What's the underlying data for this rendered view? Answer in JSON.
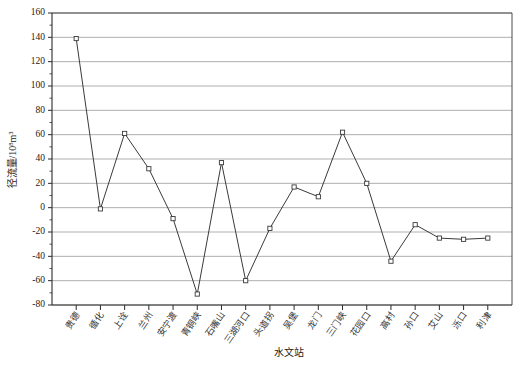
{
  "chart_data": {
    "type": "line",
    "title": "",
    "xlabel": "水文站",
    "ylabel": "径流量/10⁸m³",
    "ylabel_base": "径流量/10",
    "ylabel_exp": "8",
    "ylabel_unit": "m³",
    "ylim": [
      -80,
      160
    ],
    "ytick_step": 20,
    "yticks": [
      160,
      140,
      120,
      100,
      80,
      60,
      40,
      20,
      0,
      -20,
      -40,
      -60,
      -80
    ],
    "ytick_labels": [
      "160",
      "140",
      "120",
      "100",
      "80",
      "60",
      "40",
      "20",
      "0",
      "-20",
      "-40",
      "-60",
      "-80"
    ],
    "grid": true,
    "grid_orientation": "horizontal",
    "legend": "none",
    "marker": "open-square",
    "line_color": "#3a3a3a",
    "marker_fill": "#ffffff",
    "grid_color": "#8c8c8c",
    "categories": [
      "贵德",
      "循化",
      "上诠",
      "兰州",
      "安宁渡",
      "青铜峡",
      "石嘴山",
      "三湖河口",
      "头道拐",
      "吴堡",
      "龙门",
      "三门峡",
      "花园口",
      "高村",
      "孙口",
      "艾山",
      "泺口",
      "利津"
    ],
    "points": [
      {
        "station": "贵德",
        "value": 139
      },
      {
        "station": "循化",
        "value": -1
      },
      {
        "station": "上诠",
        "value": 61
      },
      {
        "station": "兰州",
        "value": 32
      },
      {
        "station": "安宁渡",
        "value": -9
      },
      {
        "station": "青铜峡",
        "value": -71
      },
      {
        "station": "石嘴山",
        "value": 37
      },
      {
        "station": "三湖河口",
        "value": -60
      },
      {
        "station": "头道拐",
        "value": -17
      },
      {
        "station": "吴堡",
        "value": 17
      },
      {
        "station": "龙门",
        "value": 9
      },
      {
        "station": "三门峡",
        "value": 62
      },
      {
        "station": "花园口",
        "value": 20
      },
      {
        "station": "高村",
        "value": -44
      },
      {
        "station": "孙口",
        "value": -14
      },
      {
        "station": "艾山",
        "value": -25
      },
      {
        "station": "泺口",
        "value": -26
      },
      {
        "station": "利津",
        "value": -25
      }
    ],
    "values": [
      139,
      -1,
      61,
      32,
      -9,
      -71,
      37,
      -60,
      -17,
      17,
      9,
      62,
      20,
      -44,
      -14,
      -25,
      -26,
      -25
    ]
  }
}
